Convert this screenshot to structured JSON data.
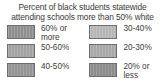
{
  "title": {
    "line1": "Percent of black students statewide",
    "line2": "attending schools more than 50% white"
  },
  "chart_data": {
    "type": "table",
    "title": "Percent of black students statewide attending schools more than 50% white",
    "subtitle": "",
    "xlabel": "",
    "ylabel": "",
    "legend_position": "two-column grid",
    "grid": false,
    "categories": [
      "60% or more",
      "50-60%",
      "40-50%",
      "30-40%",
      "20-30%",
      "20% or less"
    ],
    "values": [
      60,
      55,
      45,
      35,
      25,
      20
    ],
    "colors": [
      "#8f8f8f",
      "#a2a2a2",
      "#949494",
      "#b6b6b6",
      "#a8a8a8",
      "#8c8c8c"
    ]
  },
  "legend": {
    "columns": [
      {
        "name": "left-column",
        "items": [
          {
            "label": "60% or\nmore",
            "color": "#8f8f8f"
          },
          {
            "label": "50-60%",
            "color": "#a2a2a2"
          },
          {
            "label": "40-50%",
            "color": "#949494"
          }
        ]
      },
      {
        "name": "right-column",
        "items": [
          {
            "label": "30-40%",
            "color": "#b6b6b6"
          },
          {
            "label": "20-30%",
            "color": "#a8a8a8"
          },
          {
            "label": "20% or\nless",
            "color": "#8c8c8c"
          }
        ]
      }
    ]
  }
}
